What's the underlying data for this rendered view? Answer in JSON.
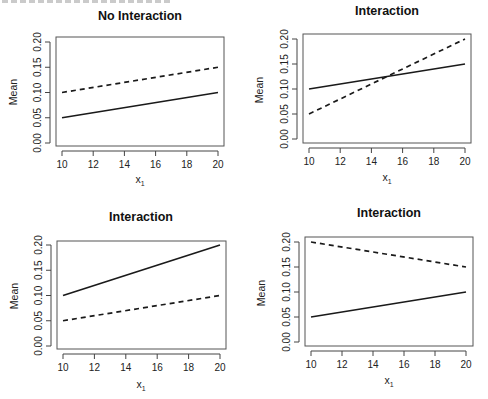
{
  "figure": {
    "layout": "2x2 grid of line plots",
    "line_styles": {
      "solid": "#1a1a1a",
      "dashed": "#1a1a1a"
    }
  },
  "panels": [
    {
      "title": "No Interaction",
      "xlabel": "x",
      "xlabel_subscript": "1",
      "ylabel": "Mean"
    },
    {
      "title": "Interaction",
      "xlabel": "x",
      "xlabel_subscript": "1",
      "ylabel": "Mean"
    },
    {
      "title": "Interaction",
      "xlabel": "x",
      "xlabel_subscript": "1",
      "ylabel": "Mean"
    },
    {
      "title": "Interaction",
      "xlabel": "x",
      "xlabel_subscript": "1",
      "ylabel": "Mean"
    }
  ],
  "axis": {
    "xticks": [
      "10",
      "12",
      "14",
      "16",
      "18",
      "20"
    ],
    "yticks": [
      "0.00",
      "0.05",
      "0.10",
      "0.15",
      "0.20"
    ]
  },
  "chart_data": [
    {
      "type": "line",
      "title": "No Interaction",
      "xlabel": "x1",
      "ylabel": "Mean",
      "x": [
        10,
        20
      ],
      "xlim": [
        10,
        20
      ],
      "ylim": [
        0,
        0.2
      ],
      "xticks": [
        10,
        12,
        14,
        16,
        18,
        20
      ],
      "yticks": [
        0.0,
        0.05,
        0.1,
        0.15,
        0.2
      ],
      "grid": false,
      "series": [
        {
          "name": "solid",
          "style": "solid",
          "values": [
            0.05,
            0.1
          ]
        },
        {
          "name": "dashed",
          "style": "dashed",
          "values": [
            0.1,
            0.15
          ]
        }
      ]
    },
    {
      "type": "line",
      "title": "Interaction",
      "xlabel": "x1",
      "ylabel": "Mean",
      "x": [
        10,
        20
      ],
      "xlim": [
        10,
        20
      ],
      "ylim": [
        0,
        0.2
      ],
      "xticks": [
        10,
        12,
        14,
        16,
        18,
        20
      ],
      "yticks": [
        0.0,
        0.05,
        0.1,
        0.15,
        0.2
      ],
      "grid": false,
      "series": [
        {
          "name": "solid",
          "style": "solid",
          "values": [
            0.1,
            0.15
          ]
        },
        {
          "name": "dashed",
          "style": "dashed",
          "values": [
            0.05,
            0.2
          ]
        }
      ]
    },
    {
      "type": "line",
      "title": "Interaction",
      "xlabel": "x1",
      "ylabel": "Mean",
      "x": [
        10,
        20
      ],
      "xlim": [
        10,
        20
      ],
      "ylim": [
        0,
        0.2
      ],
      "xticks": [
        10,
        12,
        14,
        16,
        18,
        20
      ],
      "yticks": [
        0.0,
        0.05,
        0.1,
        0.15,
        0.2
      ],
      "grid": false,
      "series": [
        {
          "name": "solid",
          "style": "solid",
          "values": [
            0.1,
            0.2
          ]
        },
        {
          "name": "dashed",
          "style": "dashed",
          "values": [
            0.05,
            0.1
          ]
        }
      ]
    },
    {
      "type": "line",
      "title": "Interaction",
      "xlabel": "x1",
      "ylabel": "Mean",
      "x": [
        10,
        20
      ],
      "xlim": [
        10,
        20
      ],
      "ylim": [
        0,
        0.2
      ],
      "xticks": [
        10,
        12,
        14,
        16,
        18,
        20
      ],
      "yticks": [
        0.0,
        0.05,
        0.1,
        0.15,
        0.2
      ],
      "grid": false,
      "series": [
        {
          "name": "solid",
          "style": "solid",
          "values": [
            0.05,
            0.1
          ]
        },
        {
          "name": "dashed",
          "style": "dashed",
          "values": [
            0.2,
            0.15
          ]
        }
      ]
    }
  ]
}
